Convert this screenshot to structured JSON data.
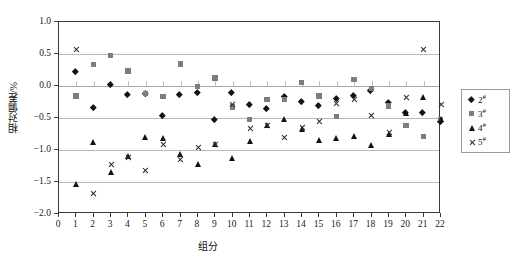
{
  "chart_data": {
    "type": "scatter",
    "title": "",
    "xlabel": "组分",
    "ylabel": "相对偏差/%",
    "xlim": [
      0,
      22
    ],
    "ylim": [
      -2.0,
      1.0
    ],
    "yticks": [
      "1.0",
      "0.5",
      "0.0",
      "-0.5",
      "-1.0",
      "-1.5",
      "-2.0"
    ],
    "ytick_values": [
      1.0,
      0.5,
      0.0,
      -0.5,
      -1.0,
      -1.5,
      -2.0
    ],
    "xticks": [
      "0",
      "1",
      "2",
      "3",
      "4",
      "5",
      "6",
      "7",
      "8",
      "9",
      "10",
      "11",
      "12",
      "13",
      "14",
      "15",
      "16",
      "17",
      "18",
      "19",
      "20",
      "21",
      "22"
    ],
    "xtick_values": [
      0,
      1,
      2,
      3,
      4,
      5,
      6,
      7,
      8,
      9,
      10,
      11,
      12,
      13,
      14,
      15,
      16,
      17,
      18,
      19,
      20,
      21,
      22
    ],
    "grid": "horizontal",
    "legend_position": "right-outside",
    "x": [
      1,
      2,
      3,
      4,
      5,
      6,
      7,
      8,
      9,
      10,
      11,
      12,
      13,
      14,
      15,
      16,
      17,
      18,
      19,
      20,
      21,
      22
    ],
    "series": [
      {
        "name": "2#",
        "marker": "diamond",
        "color": "#131313",
        "values": [
          0.21,
          -0.34,
          0.02,
          -0.15,
          -0.13,
          -0.47,
          -0.15,
          -0.12,
          -0.53,
          -0.12,
          -0.3,
          -0.37,
          -0.18,
          -0.25,
          -0.32,
          -0.21,
          -0.16,
          -0.08,
          -0.27,
          -0.43,
          -0.42,
          -0.56
        ]
      },
      {
        "name": "3#",
        "marker": "square",
        "color": "#7d7d7d",
        "values": [
          -0.16,
          0.33,
          0.47,
          0.23,
          -0.12,
          -0.17,
          0.34,
          -0.01,
          0.12,
          -0.33,
          -0.53,
          -0.22,
          -0.22,
          0.05,
          -0.16,
          -0.48,
          0.1,
          -0.04,
          -0.32,
          -0.62,
          -0.79,
          -0.53
        ]
      },
      {
        "name": "4#",
        "marker": "triangle",
        "color": "#131313",
        "values": [
          -1.53,
          -0.88,
          -1.34,
          -1.1,
          -0.8,
          -0.81,
          -1.06,
          -1.22,
          -0.91,
          -1.13,
          -0.86,
          -0.62,
          -0.52,
          -0.68,
          -0.85,
          -0.82,
          -0.79,
          -0.93,
          -0.75,
          -0.42,
          -0.17,
          -0.52
        ]
      },
      {
        "name": "5#",
        "marker": "cross",
        "color": "#2a2a2a",
        "values": [
          0.57,
          -1.68,
          -1.22,
          -1.11,
          -1.32,
          -0.91,
          -1.14,
          -0.96,
          -0.91,
          -0.28,
          -0.66,
          -0.62,
          -0.8,
          -0.64,
          -0.55,
          -0.27,
          -0.21,
          -0.46,
          -0.72,
          -0.17,
          0.57,
          -0.29
        ]
      }
    ]
  },
  "legend": {
    "items": [
      {
        "label": "2",
        "sup": "#",
        "marker": "diamond"
      },
      {
        "label": "3",
        "sup": "#",
        "marker": "square"
      },
      {
        "label": "4",
        "sup": "#",
        "marker": "triangle"
      },
      {
        "label": "5",
        "sup": "#",
        "marker": "cross"
      }
    ]
  }
}
